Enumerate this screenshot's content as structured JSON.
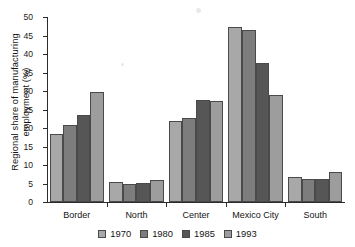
{
  "chart_data": {
    "type": "bar",
    "title": "",
    "xlabel": "",
    "ylabel_line1": "Regional share of manufacturing",
    "ylabel_line2": "employment (%)",
    "categories": [
      "Border",
      "North",
      "Center",
      "Mexico City",
      "South"
    ],
    "series": [
      {
        "name": "1970",
        "color": "#a8a8a8",
        "values": [
          18.5,
          5.4,
          21.8,
          47.3,
          6.8
        ]
      },
      {
        "name": "1980",
        "color": "#7d7d7d",
        "values": [
          20.9,
          4.9,
          22.8,
          46.5,
          6.1
        ]
      },
      {
        "name": "1985",
        "color": "#565656",
        "values": [
          23.5,
          5.2,
          27.6,
          37.5,
          6.1
        ]
      },
      {
        "name": "1993",
        "color": "#9d9d9d",
        "values": [
          29.8,
          5.9,
          27.4,
          28.8,
          8.0
        ]
      }
    ],
    "ylim": [
      0,
      50
    ],
    "ytick_step": 5,
    "yticks": [
      "0",
      "5",
      "10",
      "15",
      "20",
      "25",
      "30",
      "35",
      "40",
      "45",
      "50"
    ],
    "grid": false,
    "legend_position": "bottom",
    "legend_entries": [
      "1970",
      "1980",
      "1985",
      "1993"
    ]
  },
  "colors": {
    "axis": "#2b2b2b",
    "text": "#141414",
    "background": "#ffffff"
  }
}
